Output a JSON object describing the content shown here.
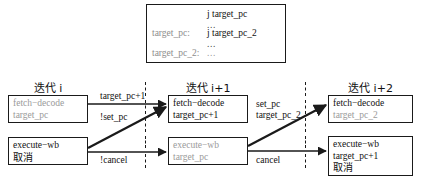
{
  "code_box": {
    "rows": [
      {
        "label": "",
        "instr": "j target_pc",
        "dots": ""
      },
      {
        "label": "",
        "instr": "",
        "dots": "..."
      },
      {
        "label": "target_pc:",
        "instr": "j target_pc_2",
        "dots": ""
      },
      {
        "label": "",
        "instr": "",
        "dots": "..."
      },
      {
        "label": "target_pc_2:",
        "instr": "",
        "dots": "..."
      }
    ]
  },
  "columns": [
    {
      "title": "迭代 i",
      "fetch": {
        "l1": "fetch−decode",
        "l2": "target_pc",
        "l3": "",
        "gray": [
          true,
          true,
          false
        ]
      },
      "exec": {
        "l1": "execute−wb",
        "l2": "取消",
        "l3": "",
        "gray": [
          false,
          false,
          false
        ]
      }
    },
    {
      "title": "迭代 i+1",
      "fetch": {
        "l1": "fetch−decode",
        "l2": "target_pc+1",
        "l3": "",
        "gray": [
          false,
          false,
          false
        ]
      },
      "exec": {
        "l1": "execute−wb",
        "l2": "target_pc",
        "l3": "",
        "gray": [
          true,
          true,
          false
        ]
      }
    },
    {
      "title": "迭代 i+2",
      "fetch": {
        "l1": "fetch−decode",
        "l2": "target_pc_2",
        "l3": "",
        "gray": [
          false,
          true,
          false
        ]
      },
      "exec": {
        "l1": "execute−wb",
        "l2": "target_pc+1",
        "l3": "取消",
        "gray": [
          false,
          false,
          false
        ]
      }
    }
  ],
  "edges": {
    "top_left": "target_pc+1",
    "mid_left": "!set_pc",
    "bottom_left": "!cancel",
    "top_right_1": "set_pc",
    "top_right_2": "target_pc_2",
    "bottom_right": "cancel"
  },
  "colors": {
    "ink": "#1a1a1a",
    "gray_text": "#9a9a9a",
    "background": "#ffffff"
  }
}
